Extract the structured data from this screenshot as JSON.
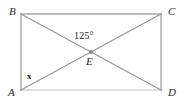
{
  "figure": {
    "type": "geometry-diagram",
    "background_color": "#ffffff",
    "line_color": "#a0a0a0",
    "point_color": "#8c8c8c",
    "text_color": "#2b2b2b",
    "vertices": [
      {
        "id": "B",
        "label": "B",
        "x": 21,
        "y": 14,
        "label_x": 9,
        "label_y": 6
      },
      {
        "id": "C",
        "label": "C",
        "x": 161,
        "y": 14,
        "label_x": 168,
        "label_y": 6
      },
      {
        "id": "A",
        "label": "A",
        "x": 21,
        "y": 90,
        "label_x": 8,
        "label_y": 87
      },
      {
        "id": "D",
        "label": "D",
        "x": 161,
        "y": 90,
        "label_x": 168,
        "label_y": 87
      },
      {
        "id": "E",
        "label": "E",
        "x": 91,
        "y": 52,
        "label_x": 86,
        "label_y": 56
      }
    ],
    "sides": [
      {
        "from": "B",
        "to": "C"
      },
      {
        "from": "C",
        "to": "D"
      },
      {
        "from": "D",
        "to": "A"
      },
      {
        "from": "A",
        "to": "B"
      }
    ],
    "diagonals": [
      {
        "from": "B",
        "to": "D"
      },
      {
        "from": "A",
        "to": "C"
      }
    ],
    "angles": [
      {
        "id": "angle-BEC",
        "at_vertex": "E",
        "label": "125°",
        "value": 125,
        "unit": "degrees",
        "label_x": 74,
        "label_y": 31
      },
      {
        "id": "angle-BAC",
        "at_vertex": "A",
        "label": "x",
        "value": null,
        "unit": "unknown",
        "label_x": 27,
        "label_y": 72
      }
    ]
  }
}
